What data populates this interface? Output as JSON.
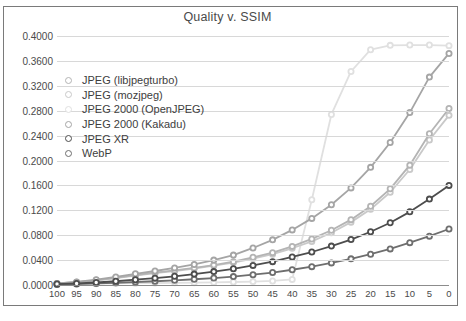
{
  "figure": {
    "title": "Quality v. SSIM",
    "caption_partial": ""
  },
  "chart_data": {
    "type": "line",
    "title": "Quality v. SSIM",
    "xlabel": "",
    "ylabel": "",
    "xlim": [
      100,
      0
    ],
    "ylim": [
      0.0,
      0.4
    ],
    "x_reversed": true,
    "grid": true,
    "legend_position": "inside-top-left",
    "x": [
      100,
      95,
      90,
      85,
      80,
      75,
      70,
      65,
      60,
      55,
      50,
      45,
      40,
      35,
      30,
      25,
      20,
      15,
      10,
      5,
      0
    ],
    "xtick_labels": [
      "100",
      "95",
      "90",
      "85",
      "80",
      "75",
      "70",
      "65",
      "60",
      "55",
      "50",
      "45",
      "40",
      "35",
      "30",
      "25",
      "20",
      "15",
      "10",
      "5",
      "0"
    ],
    "ytick_labels": [
      "0.0000",
      "0.0400",
      "0.0800",
      "0.1200",
      "0.1600",
      "0.2000",
      "0.2400",
      "0.2800",
      "0.3200",
      "0.3600",
      "0.4000"
    ],
    "ytick_values": [
      0.0,
      0.04,
      0.08,
      0.12,
      0.16,
      0.2,
      0.24,
      0.28,
      0.32,
      0.36,
      0.4
    ],
    "series": [
      {
        "name": "JPEG (libjpegturbo)",
        "color": "#b4b4b4",
        "values": [
          0.0025,
          0.0045,
          0.0075,
          0.0115,
          0.016,
          0.02,
          0.0235,
          0.0275,
          0.032,
          0.0375,
          0.0445,
          0.052,
          0.062,
          0.074,
          0.088,
          0.105,
          0.1265,
          0.1545,
          0.1925,
          0.243,
          0.2835
        ]
      },
      {
        "name": "JPEG (mozjpeg)",
        "color": "#c9c9c9",
        "values": [
          0.0025,
          0.0045,
          0.0075,
          0.011,
          0.015,
          0.019,
          0.0225,
          0.0265,
          0.031,
          0.036,
          0.0425,
          0.0495,
          0.059,
          0.07,
          0.084,
          0.101,
          0.1215,
          0.149,
          0.1855,
          0.233,
          0.2725
        ]
      },
      {
        "name": "JPEG 2000 (OpenJPEG)",
        "color": "#e0e0e0",
        "values": [
          0.001,
          0.0015,
          0.002,
          0.0025,
          0.003,
          0.0032,
          0.0035,
          0.0038,
          0.0042,
          0.0048,
          0.0055,
          0.0065,
          0.009,
          0.137,
          0.274,
          0.343,
          0.378,
          0.385,
          0.3855,
          0.3855,
          0.3845
        ]
      },
      {
        "name": "JPEG 2000 (Kakadu)",
        "color": "#a5a5a5",
        "values": [
          0.0025,
          0.005,
          0.0085,
          0.013,
          0.018,
          0.0225,
          0.0275,
          0.033,
          0.04,
          0.048,
          0.0595,
          0.0725,
          0.0885,
          0.107,
          0.129,
          0.156,
          0.189,
          0.229,
          0.277,
          0.334,
          0.372
        ]
      },
      {
        "name": "JPEG XR",
        "color": "#4d4d4d",
        "values": [
          0.0015,
          0.0025,
          0.004,
          0.006,
          0.0085,
          0.011,
          0.014,
          0.0175,
          0.0215,
          0.026,
          0.0315,
          0.0375,
          0.045,
          0.053,
          0.0625,
          0.073,
          0.0855,
          0.1,
          0.1175,
          0.138,
          0.16
        ]
      },
      {
        "name": "WebP",
        "color": "#6e6e6e",
        "values": [
          0.001,
          0.0015,
          0.0025,
          0.0035,
          0.0048,
          0.006,
          0.0075,
          0.0092,
          0.0112,
          0.0135,
          0.0165,
          0.02,
          0.0245,
          0.0295,
          0.0355,
          0.042,
          0.0495,
          0.058,
          0.068,
          0.0785,
          0.09
        ]
      }
    ]
  }
}
